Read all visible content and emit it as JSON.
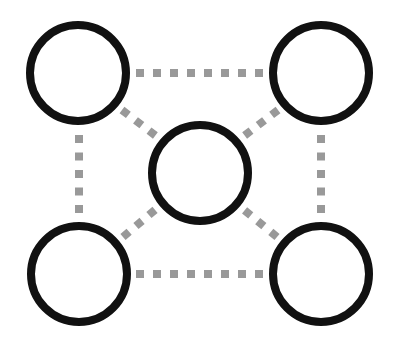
{
  "diagram": {
    "type": "network-topology",
    "colors": {
      "background": "#ffffff",
      "node_stroke": "#111111",
      "node_fill": "#ffffff",
      "edge": "#999999"
    },
    "node_radius": 48,
    "node_stroke_width": 8,
    "edge_style": "dotted-squares",
    "nodes": [
      {
        "id": "top-left",
        "cx": 78,
        "cy": 73
      },
      {
        "id": "top-right",
        "cx": 321,
        "cy": 73
      },
      {
        "id": "center",
        "cx": 200,
        "cy": 173
      },
      {
        "id": "bottom-left",
        "cx": 79,
        "cy": 274
      },
      {
        "id": "bottom-right",
        "cx": 321,
        "cy": 274
      }
    ],
    "edges": [
      {
        "from": "top-left",
        "to": "top-right",
        "dots": 8
      },
      {
        "from": "bottom-left",
        "to": "bottom-right",
        "dots": 8
      },
      {
        "from": "top-left",
        "to": "bottom-left",
        "dots": 5
      },
      {
        "from": "top-right",
        "to": "bottom-right",
        "dots": 5
      },
      {
        "from": "top-left",
        "to": "center",
        "dots": 3
      },
      {
        "from": "top-right",
        "to": "center",
        "dots": 3
      },
      {
        "from": "bottom-left",
        "to": "center",
        "dots": 3
      },
      {
        "from": "bottom-right",
        "to": "center",
        "dots": 3
      }
    ]
  }
}
